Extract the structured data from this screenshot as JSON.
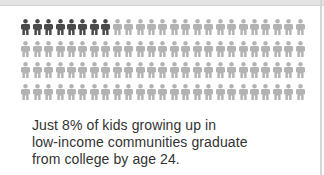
{
  "chart_data": {
    "type": "pictogram",
    "title": "",
    "total_icons": 100,
    "rows": 4,
    "icons_per_row": 25,
    "highlighted_count": 8,
    "highlighted_percent": 8,
    "categories": [
      "Graduate from college by age 24",
      "Do not graduate by age 24"
    ],
    "values": [
      8,
      92
    ],
    "annotation": "Just 8% of kids growing up in low-income communities graduate from college by age 24."
  },
  "colors": {
    "highlight": "#4a4a4a",
    "base": "#b3b3b3",
    "text": "#333333"
  },
  "caption": {
    "lines": [
      "Just 8% of kids growing up in",
      "low-income communities graduate",
      "from college by age 24."
    ]
  }
}
